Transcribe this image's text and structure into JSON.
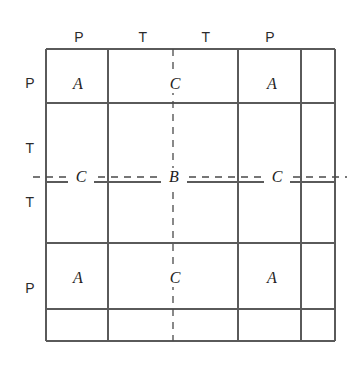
{
  "figure": {
    "title": "",
    "grid": {
      "x_lines": [
        46,
        108,
        238,
        301,
        335
      ],
      "y_lines": [
        49,
        103,
        182,
        243,
        309,
        341
      ],
      "left": 46,
      "top": 49,
      "right": 335,
      "bottom": 341,
      "line_color": "#5a5a5a",
      "dash_color": "#4a4a4a"
    },
    "dashed_lines": {
      "vertical_x": 173,
      "horizontal_y": 177
    },
    "column_headers": [
      {
        "label": "P",
        "x": 79,
        "y": 37
      },
      {
        "label": "T",
        "x": 143,
        "y": 37
      },
      {
        "label": "T",
        "x": 206,
        "y": 37
      },
      {
        "label": "P",
        "x": 270,
        "y": 37
      }
    ],
    "row_headers": [
      {
        "label": "P",
        "x": 30,
        "y": 83
      },
      {
        "label": "T",
        "x": 30,
        "y": 148
      },
      {
        "label": "T",
        "x": 30,
        "y": 202
      },
      {
        "label": "P",
        "x": 30,
        "y": 288
      }
    ],
    "cell_letters": [
      {
        "label": "A",
        "x": 78,
        "y": 84,
        "on_dash": false
      },
      {
        "label": "C",
        "x": 174,
        "y": 84,
        "on_dash": true
      },
      {
        "label": "A",
        "x": 272,
        "y": 84,
        "on_dash": false
      },
      {
        "label": "C",
        "x": 80,
        "y": 177,
        "on_dash": true
      },
      {
        "label": "B",
        "x": 173,
        "y": 177,
        "on_dash": true
      },
      {
        "label": "C",
        "x": 276,
        "y": 177,
        "on_dash": true
      },
      {
        "label": "A",
        "x": 78,
        "y": 278,
        "on_dash": false
      },
      {
        "label": "C",
        "x": 174,
        "y": 278,
        "on_dash": true
      },
      {
        "label": "A",
        "x": 272,
        "y": 278,
        "on_dash": false
      }
    ]
  }
}
